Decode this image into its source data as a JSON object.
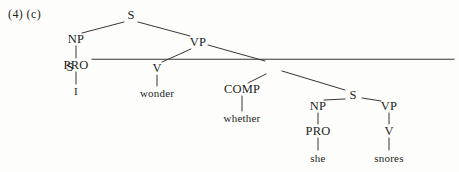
{
  "figure": {
    "example_label": "(4) (c)",
    "sentence": "I wonder whether she snores",
    "ink_color": "#221f1c",
    "paper_color": "#fdfdfb"
  },
  "tree": {
    "nodes": [
      {
        "id": "s-root",
        "label": "S",
        "kind": "category",
        "bar": false,
        "x": 131,
        "y": 15
      },
      {
        "id": "np-1",
        "label": "NP",
        "kind": "category",
        "bar": false,
        "x": 76,
        "y": 39
      },
      {
        "id": "pro-1",
        "label": "PRO",
        "kind": "category",
        "bar": false,
        "x": 76,
        "y": 65
      },
      {
        "id": "term-i",
        "label": "I",
        "kind": "terminal",
        "bar": false,
        "x": 76,
        "y": 91
      },
      {
        "id": "vp-1",
        "label": "VP",
        "kind": "category",
        "bar": false,
        "x": 198,
        "y": 42
      },
      {
        "id": "v-1",
        "label": "V",
        "kind": "category",
        "bar": false,
        "x": 157,
        "y": 68
      },
      {
        "id": "term-wonder",
        "label": "wonder",
        "kind": "terminal",
        "bar": false,
        "x": 157,
        "y": 93
      },
      {
        "id": "sbar",
        "label": "S",
        "kind": "category",
        "bar": true,
        "x": 273,
        "y": 67
      },
      {
        "id": "comp-1",
        "label": "COMP",
        "kind": "category",
        "bar": false,
        "x": 242,
        "y": 89
      },
      {
        "id": "term-whether",
        "label": "whether",
        "kind": "terminal",
        "bar": false,
        "x": 242,
        "y": 118
      },
      {
        "id": "s-embed",
        "label": "S",
        "kind": "category",
        "bar": false,
        "x": 353,
        "y": 95
      },
      {
        "id": "np-2",
        "label": "NP",
        "kind": "category",
        "bar": false,
        "x": 318,
        "y": 106
      },
      {
        "id": "pro-2",
        "label": "PRO",
        "kind": "category",
        "bar": false,
        "x": 318,
        "y": 131
      },
      {
        "id": "term-she",
        "label": "she",
        "kind": "terminal",
        "bar": false,
        "x": 318,
        "y": 158
      },
      {
        "id": "vp-2",
        "label": "VP",
        "kind": "category",
        "bar": false,
        "x": 389,
        "y": 106
      },
      {
        "id": "v-2",
        "label": "V",
        "kind": "category",
        "bar": false,
        "x": 389,
        "y": 131
      },
      {
        "id": "term-snores",
        "label": "snores",
        "kind": "terminal",
        "bar": false,
        "x": 389,
        "y": 158
      }
    ],
    "edges": [
      {
        "from": "s-root",
        "to": "np-1",
        "x1": 124,
        "y1": 22,
        "x2": 82,
        "y2": 33
      },
      {
        "from": "s-root",
        "to": "vp-1",
        "x1": 138,
        "y1": 22,
        "x2": 190,
        "y2": 36
      },
      {
        "from": "np-1",
        "to": "pro-1",
        "x1": 76,
        "y1": 46,
        "x2": 76,
        "y2": 58
      },
      {
        "from": "pro-1",
        "to": "term-i",
        "x1": 76,
        "y1": 72,
        "x2": 76,
        "y2": 84
      },
      {
        "from": "vp-1",
        "to": "v-1",
        "x1": 191,
        "y1": 49,
        "x2": 162,
        "y2": 62
      },
      {
        "from": "vp-1",
        "to": "sbar",
        "x1": 208,
        "y1": 45,
        "x2": 265,
        "y2": 61
      },
      {
        "from": "v-1",
        "to": "term-wonder",
        "x1": 157,
        "y1": 75,
        "x2": 157,
        "y2": 86
      },
      {
        "from": "sbar",
        "to": "comp-1",
        "x1": 266,
        "y1": 74,
        "x2": 248,
        "y2": 83
      },
      {
        "from": "sbar",
        "to": "s-embed",
        "x1": 282,
        "y1": 71,
        "x2": 345,
        "y2": 90
      },
      {
        "from": "comp-1",
        "to": "term-whether",
        "x1": 242,
        "y1": 96,
        "x2": 242,
        "y2": 111
      },
      {
        "from": "s-embed",
        "to": "np-2",
        "x1": 345,
        "y1": 99,
        "x2": 324,
        "y2": 100
      },
      {
        "from": "s-embed",
        "to": "vp-2",
        "x1": 362,
        "y1": 98,
        "x2": 381,
        "y2": 101
      },
      {
        "from": "np-2",
        "to": "pro-2",
        "x1": 318,
        "y1": 113,
        "x2": 318,
        "y2": 124
      },
      {
        "from": "pro-2",
        "to": "term-she",
        "x1": 318,
        "y1": 138,
        "x2": 318,
        "y2": 150
      },
      {
        "from": "vp-2",
        "to": "v-2",
        "x1": 389,
        "y1": 113,
        "x2": 389,
        "y2": 124
      },
      {
        "from": "v-2",
        "to": "term-snores",
        "x1": 389,
        "y1": 138,
        "x2": 389,
        "y2": 150
      }
    ]
  }
}
